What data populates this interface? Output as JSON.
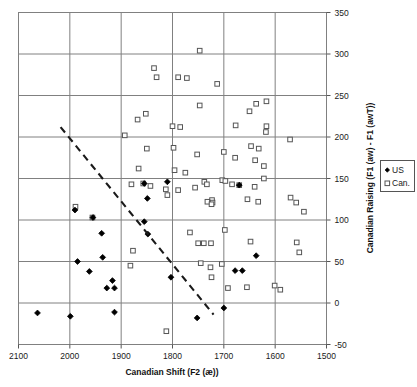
{
  "chart_data": {
    "type": "scatter",
    "title": "",
    "xlabel": "Canadian Shift (F2 (æ))",
    "ylabel": "Canadian Raising (F1 (aw) - F1 (awT))",
    "xlim": [
      2100,
      1500
    ],
    "ylim": [
      -50,
      350
    ],
    "x_reversed": true,
    "xticks": [
      2100,
      2000,
      1900,
      1800,
      1700,
      1600,
      1500
    ],
    "yticks": [
      -50,
      0,
      50,
      100,
      150,
      200,
      250,
      300,
      350
    ],
    "xtick_labels": [
      "2100",
      "2000",
      "1900",
      "1800",
      "1700",
      "1600",
      "1500"
    ],
    "ytick_labels": [
      "-50",
      "0",
      "50",
      "100",
      "150",
      "200",
      "250",
      "300",
      "350"
    ],
    "grid": true,
    "grid_color": "#808080",
    "legend_position": "right-outside",
    "legend": [
      {
        "name": "US",
        "marker": "filled-diamond",
        "color": "#000000"
      },
      {
        "name": "Can.",
        "marker": "open-square",
        "color": "#555555"
      }
    ],
    "series": [
      {
        "name": "US",
        "marker": "filled-diamond",
        "color": "#000000",
        "points": [
          [
            1990,
            112
          ],
          [
            1955,
            103
          ],
          [
            1938,
            84
          ],
          [
            1936,
            55
          ],
          [
            1985,
            50
          ],
          [
            1962,
            38
          ],
          [
            1917,
            27
          ],
          [
            1928,
            18
          ],
          [
            1913,
            18
          ],
          [
            1855,
            144
          ],
          [
            1849,
            126
          ],
          [
            1855,
            98
          ],
          [
            1803,
            31
          ],
          [
            1848,
            83
          ],
          [
            2063,
            -12
          ],
          [
            1999,
            -16
          ],
          [
            1913,
            -11
          ],
          [
            1752,
            -18
          ],
          [
            1700,
            -6
          ],
          [
            1678,
            39
          ],
          [
            1664,
            39
          ],
          [
            1637,
            57
          ],
          [
            1670,
            142
          ],
          [
            1810,
            146
          ]
        ]
      },
      {
        "name": "Can.",
        "marker": "open-square",
        "color": "#555555",
        "points": [
          [
            1747,
            304
          ],
          [
            1836,
            283
          ],
          [
            1831,
            272
          ],
          [
            1789,
            272
          ],
          [
            1772,
            271
          ],
          [
            1713,
            264
          ],
          [
            1617,
            243
          ],
          [
            1637,
            240
          ],
          [
            1747,
            238
          ],
          [
            1852,
            228
          ],
          [
            1868,
            221
          ],
          [
            1650,
            231
          ],
          [
            1800,
            213
          ],
          [
            1785,
            212
          ],
          [
            1677,
            214
          ],
          [
            1617,
            213
          ],
          [
            1618,
            206
          ],
          [
            1893,
            202
          ],
          [
            1571,
            197
          ],
          [
            1647,
            189
          ],
          [
            1632,
            186
          ],
          [
            1850,
            186
          ],
          [
            1798,
            187
          ],
          [
            1752,
            179
          ],
          [
            1678,
            175
          ],
          [
            1639,
            172
          ],
          [
            1700,
            182
          ],
          [
            1622,
            165
          ],
          [
            1866,
            162
          ],
          [
            1796,
            160
          ],
          [
            1775,
            157
          ],
          [
            1622,
            150
          ],
          [
            1703,
            148
          ],
          [
            1697,
            147
          ],
          [
            1738,
            146
          ],
          [
            1733,
            143
          ],
          [
            1684,
            143
          ],
          [
            1670,
            142
          ],
          [
            1640,
            140
          ],
          [
            1857,
            144
          ],
          [
            1880,
            143
          ],
          [
            1843,
            141
          ],
          [
            1813,
            137
          ],
          [
            1789,
            136
          ],
          [
            1756,
            139
          ],
          [
            1810,
            130
          ],
          [
            1723,
            124
          ],
          [
            1654,
            125
          ],
          [
            1633,
            122
          ],
          [
            1570,
            127
          ],
          [
            1559,
            121
          ],
          [
            1732,
            122
          ],
          [
            1722,
            121
          ],
          [
            1724,
            119
          ],
          [
            1989,
            116
          ],
          [
            1956,
            103
          ],
          [
            1544,
            110
          ],
          [
            1698,
            88
          ],
          [
            1766,
            85
          ],
          [
            1750,
            72
          ],
          [
            1739,
            72
          ],
          [
            1725,
            72
          ],
          [
            1648,
            74
          ],
          [
            1558,
            73
          ],
          [
            1553,
            61
          ],
          [
            1877,
            63
          ],
          [
            1882,
            45
          ],
          [
            1745,
            48
          ],
          [
            1726,
            43
          ],
          [
            1704,
            47
          ],
          [
            1724,
            31
          ],
          [
            1692,
            18
          ],
          [
            1655,
            19
          ],
          [
            1601,
            21
          ],
          [
            1590,
            16
          ],
          [
            1812,
            -34
          ]
        ]
      }
    ],
    "trend_line": {
      "style": "dashed",
      "color": "#1a1a1a",
      "x_start": 2018,
      "y_start": 212,
      "x_end": 1720,
      "y_end": -14
    }
  },
  "axes": {
    "x_title": "Canadian Shift (F2 (æ))",
    "y_title": "Canadian Raising (F1 (aw) - F1 (awT))"
  },
  "legend_box": {
    "us_label": "US",
    "can_label": "Can."
  }
}
